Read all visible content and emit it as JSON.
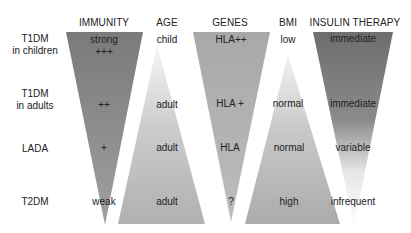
{
  "headers": {
    "immunity": "IMMUNITY",
    "age": "AGE",
    "genes": "GENES",
    "bmi": "BMI",
    "insulin": "INSULIN THERAPY"
  },
  "rows": [
    {
      "label_line1": "T1DM",
      "label_line2": "in children",
      "immunity": "strong",
      "immunity_level": "+++",
      "age": "child",
      "genes": "HLA++",
      "bmi": "low",
      "insulin": "immediate"
    },
    {
      "label_line1": "T1DM",
      "label_line2": "in adults",
      "immunity": "++",
      "age": "adult",
      "genes": "HLA +",
      "bmi": "normal",
      "insulin": "immediate"
    },
    {
      "label_line1": "LADA",
      "immunity": "+",
      "age": "adult",
      "genes": "HLA",
      "bmi": "normal",
      "insulin": "variable"
    },
    {
      "label_line1": "T2DM",
      "immunity": "weak",
      "age": "adult",
      "genes": "?",
      "bmi": "high",
      "insulin": "infrequent"
    }
  ],
  "colors": {
    "immunity_top": "#7a7a7a",
    "immunity_bottom": "#9a9a9a",
    "age_top": "#f2f2f2",
    "age_bottom": "#b2b2b2",
    "genes_top": "#a9a9a9",
    "genes_bottom": "#b9b9b9",
    "bmi_top": "#f0f0f0",
    "bmi_bottom": "#acacac",
    "insulin_top": "#6f6f6f",
    "insulin_bottom": "#ffffff"
  }
}
